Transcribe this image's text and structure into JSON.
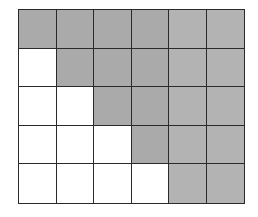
{
  "diagram": {
    "type": "grid",
    "rows": 5,
    "columns": 6,
    "shaded_color": "#aaaaaa",
    "shaded_color_light": "#b3b3b3",
    "unshaded_color": "#ffffff",
    "line_color": "#2a2a2a",
    "cells": [
      [
        1,
        1,
        1,
        1,
        1,
        1
      ],
      [
        0,
        1,
        1,
        1,
        1,
        1
      ],
      [
        0,
        0,
        1,
        1,
        1,
        1
      ],
      [
        0,
        0,
        0,
        1,
        1,
        1
      ],
      [
        0,
        0,
        0,
        0,
        1,
        1
      ]
    ],
    "shaded_count": 20,
    "unshaded_count": 10
  }
}
